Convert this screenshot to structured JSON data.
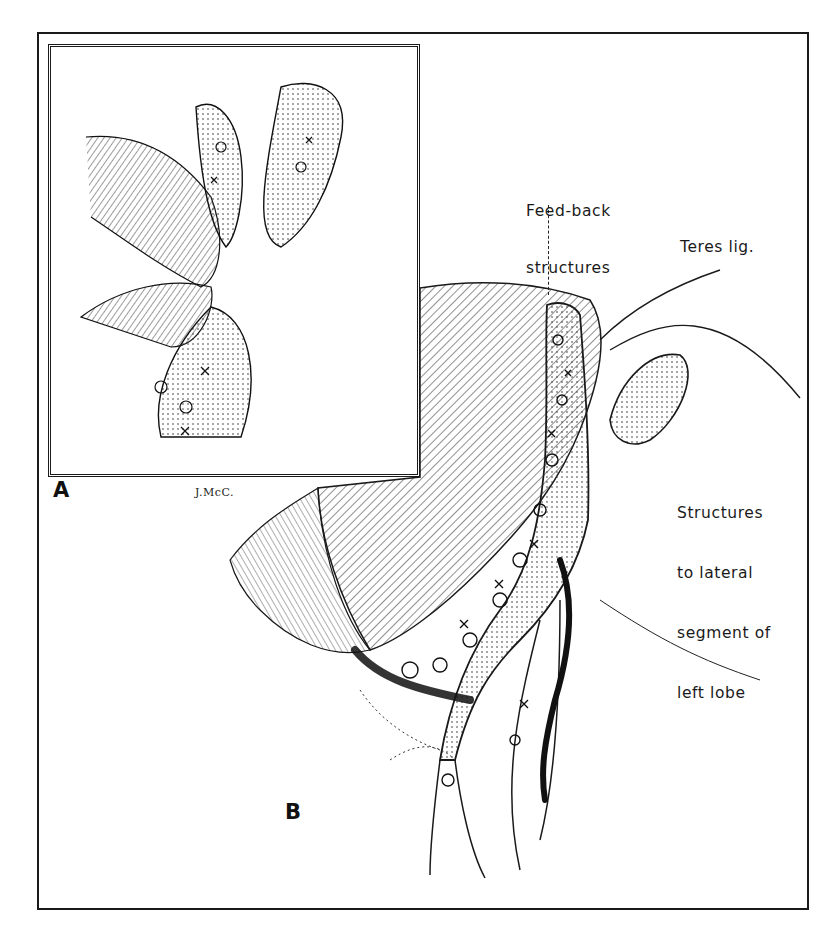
{
  "figure": {
    "panels": [
      {
        "id": "A",
        "label": "A"
      },
      {
        "id": "B",
        "label": "B"
      }
    ],
    "signature": "J.McC.",
    "annotations": {
      "feedback_line1": "Feed-back",
      "feedback_line2": "structures",
      "teres": "Teres lig.",
      "lateral_line1": "Structures",
      "lateral_line2": "to lateral",
      "lateral_line3": "segment of",
      "lateral_line4": "left lobe"
    },
    "colors": {
      "ink": "#1a1a1a",
      "paper": "#ffffff"
    }
  }
}
